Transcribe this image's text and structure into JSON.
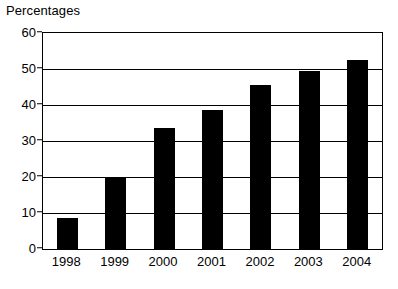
{
  "chart_data": {
    "type": "bar",
    "title": "Percentages",
    "xlabel": "",
    "ylabel": "",
    "categories": [
      "1998",
      "1999",
      "2000",
      "2001",
      "2002",
      "2003",
      "2004"
    ],
    "values": [
      8.7,
      20,
      33.5,
      38.5,
      45.5,
      49.5,
      52.5
    ],
    "series": [
      {
        "name": "Percentages",
        "values": [
          8.7,
          20,
          33.5,
          38.5,
          45.5,
          49.5,
          52.5
        ]
      }
    ],
    "ylim": [
      0,
      60
    ],
    "yticks": [
      0,
      10,
      20,
      30,
      40,
      50,
      60
    ],
    "ytick_labels": [
      "0",
      "10",
      "20",
      "30",
      "40",
      "50",
      "60"
    ],
    "grid": "horizontal",
    "legend": "none",
    "bar_color": "#000000",
    "axis_color": "#000000",
    "background_color": "#ffffff"
  }
}
